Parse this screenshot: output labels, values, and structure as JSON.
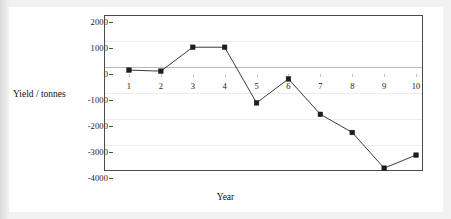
{
  "chart_data": {
    "type": "line",
    "title": "",
    "xlabel": "Year",
    "ylabel": "Yield / tonnes",
    "x": [
      1,
      2,
      3,
      4,
      5,
      6,
      7,
      8,
      9,
      10
    ],
    "categories": [
      "1",
      "2",
      "3",
      "4",
      "5",
      "6",
      "7",
      "8",
      "9",
      "10"
    ],
    "values": [
      150,
      110,
      1030,
      1030,
      -1110,
      -190,
      -1550,
      -2250,
      -3620,
      -3120
    ],
    "series": [
      {
        "name": "Yield",
        "values": [
          150,
          110,
          1030,
          1030,
          -1110,
          -190,
          -1550,
          -2250,
          -3620,
          -3120
        ]
      }
    ],
    "xlim": [
      0.5,
      10.5
    ],
    "ylim": [
      -4000,
      2000
    ],
    "ytick_labels": [
      "2000",
      "1000",
      "0",
      "-1000",
      "-2000",
      "-3000",
      "-4000"
    ],
    "ytick_values": [
      2000,
      1000,
      0,
      -1000,
      -2000,
      -3000,
      -4000
    ],
    "xtick_labels": [
      "1",
      "2",
      "3",
      "4",
      "5",
      "6",
      "7",
      "8",
      "9",
      "10"
    ],
    "grid": false,
    "zero_line": true,
    "legend": "none",
    "marker": "square",
    "line_color": "#3b3b3b",
    "marker_color": "#1d1d1d",
    "frame_color": "#4a4a4a",
    "plot_background": "#ffffff",
    "page_background": "#e8e8e8"
  },
  "axes": {
    "y_title": "Yield / tonnes",
    "x_title": "Year"
  }
}
